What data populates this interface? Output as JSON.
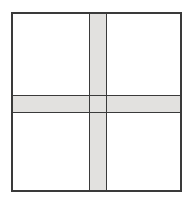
{
  "figure": {
    "type": "geometric-diagram",
    "canvas": {
      "width": 194,
      "height": 205
    },
    "colors": {
      "background": "#ffffff",
      "quadrant_fill": "#ffffff",
      "band_fill": "#e2e1df",
      "line": "#3a3a3a",
      "line_soft": "#5a5a5a"
    },
    "outer_square": {
      "label": "outer square frame",
      "x": 11,
      "y": 12,
      "width": 171,
      "height": 180,
      "stroke_width": 1.6
    },
    "vertical_band": {
      "label": "vertical gray band",
      "x": 89,
      "width": 18,
      "y": 12,
      "height": 180,
      "fill": "#e2e1df",
      "edge_stroke": "#3a3a3a"
    },
    "horizontal_band": {
      "label": "horizontal gray band",
      "y": 95,
      "height": 18,
      "x": 11,
      "width": 171,
      "fill": "#e2e1df",
      "edge_stroke": "#3a3a3a"
    },
    "quadrants": [
      {
        "name": "top-left",
        "x": 11,
        "y": 12,
        "width": 78,
        "height": 83,
        "fill": "#ffffff"
      },
      {
        "name": "top-right",
        "x": 107,
        "y": 12,
        "width": 75,
        "height": 83,
        "fill": "#ffffff"
      },
      {
        "name": "bottom-left",
        "x": 11,
        "y": 113,
        "width": 78,
        "height": 79,
        "fill": "#ffffff"
      },
      {
        "name": "bottom-right",
        "x": 107,
        "y": 113,
        "width": 75,
        "height": 79,
        "fill": "#ffffff"
      }
    ],
    "intersection": {
      "label": "band crossing region",
      "x": 89,
      "y": 95,
      "width": 18,
      "height": 18,
      "fill": "#e2e1df"
    }
  }
}
